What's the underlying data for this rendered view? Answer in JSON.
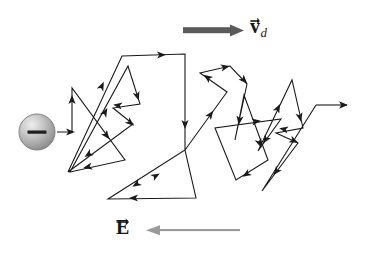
{
  "figure": {
    "background_color": "#ffffff",
    "width": 368,
    "height": 253
  },
  "labels": {
    "drift_velocity": {
      "symbol": "v",
      "subscript": "d",
      "full_text": "v_d",
      "description": "drift velocity vector label",
      "has_vector_arrow": true,
      "color": "#1a1a1a"
    },
    "electric_field": {
      "symbol": "E",
      "subscript": "",
      "full_text": "E",
      "description": "electric field vector label",
      "has_vector_arrow": true,
      "color": "#1a1a1a"
    }
  },
  "arrows": {
    "drift_velocity_arrow": {
      "direction": "right",
      "color": "#5a5a5a",
      "thickness": 6,
      "x1": 183,
      "y1": 30,
      "x2": 243,
      "y2": 30
    },
    "electric_field_arrow": {
      "direction": "left",
      "color": "#9a9a9a",
      "thickness": 3,
      "x1": 240,
      "y1": 230,
      "x2": 146,
      "y2": 230
    },
    "exit_arrow": {
      "direction": "right",
      "color": "#1a1a1a",
      "thickness": 1.1,
      "x1": 316,
      "y1": 105,
      "x2": 352,
      "y2": 105
    }
  },
  "electron": {
    "label": "electron",
    "charge_sign": "minus",
    "cx": 37,
    "cy": 132,
    "r": 18,
    "fill_light": "#e2e2e2",
    "fill_dark": "#8d8d8d",
    "stroke": "#6e6e6e"
  },
  "path": {
    "description": "random-walk zigzag trajectory of an electron drifting to the right",
    "stroke_color": "#1a1a1a",
    "stroke_width": 1.1,
    "vertices": [
      [
        57,
        132
      ],
      [
        72,
        132
      ],
      [
        72,
        88
      ],
      [
        125,
        160
      ],
      [
        70,
        172
      ],
      [
        128,
        66
      ],
      [
        140,
        104
      ],
      [
        113,
        108
      ],
      [
        133,
        124
      ],
      [
        68,
        172
      ],
      [
        122,
        56
      ],
      [
        185,
        54
      ],
      [
        185,
        150
      ],
      [
        108,
        199
      ],
      [
        196,
        198
      ],
      [
        185,
        150
      ],
      [
        227,
        92
      ],
      [
        200,
        73
      ],
      [
        230,
        66
      ],
      [
        247,
        84
      ],
      [
        235,
        140
      ],
      [
        244,
        95
      ],
      [
        268,
        160
      ],
      [
        236,
        180
      ],
      [
        215,
        128
      ],
      [
        281,
        119
      ],
      [
        258,
        151
      ],
      [
        292,
        80
      ],
      [
        303,
        128
      ],
      [
        276,
        133
      ],
      [
        298,
        143
      ],
      [
        262,
        191
      ],
      [
        316,
        105
      ]
    ],
    "segment_arrow_count": 26
  }
}
